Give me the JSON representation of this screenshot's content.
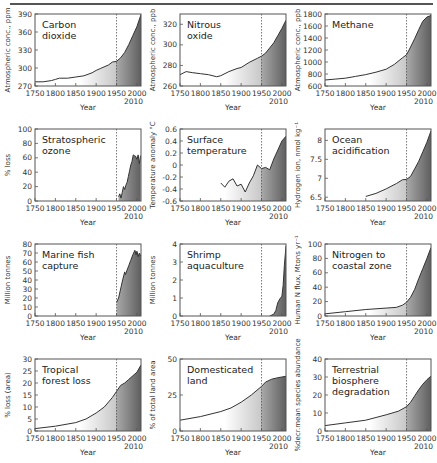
{
  "figure": {
    "shared_x_ticks": [
      "1750",
      "1800",
      "1850",
      "1900",
      "1950",
      "2000"
    ],
    "x_end_label": "2010",
    "xlabel": "Year",
    "marker_year": 1950,
    "colors": {
      "line": "#333333",
      "fill_light": "#ffffff",
      "fill_dark": "#6e6e6e",
      "frame": "#555555",
      "marker": "#555555"
    }
  },
  "chart_data": [
    {
      "type": "area",
      "title": "Carbon dioxide",
      "title_lines": [
        "Carbon",
        "dioxide"
      ],
      "xlabel": "Year",
      "ylabel": "Atmospheric conc., ppm",
      "xlim": [
        1750,
        2010
      ],
      "ylim": [
        270,
        390
      ],
      "yticks": [
        270,
        300,
        330,
        360,
        390
      ],
      "x": [
        1750,
        1770,
        1790,
        1800,
        1810,
        1830,
        1850,
        1870,
        1890,
        1900,
        1910,
        1930,
        1940,
        1950,
        1960,
        1970,
        1980,
        1990,
        2000,
        2010
      ],
      "values": [
        277,
        277,
        279,
        281,
        283,
        283,
        285,
        287,
        292,
        296,
        299,
        305,
        310,
        311,
        317,
        326,
        339,
        354,
        369,
        389
      ]
    },
    {
      "type": "area",
      "title": "Nitrous oxide",
      "title_lines": [
        "Nitrous",
        "oxide"
      ],
      "xlabel": "Year",
      "ylabel": "Atmospheric conc., ppb",
      "xlim": [
        1750,
        2010
      ],
      "ylim": [
        260,
        330
      ],
      "yticks": [
        260,
        280,
        300,
        320
      ],
      "x": [
        1750,
        1765,
        1780,
        1800,
        1820,
        1840,
        1850,
        1870,
        1890,
        1900,
        1920,
        1940,
        1950,
        1960,
        1970,
        1980,
        1990,
        2000,
        2010
      ],
      "values": [
        271,
        274,
        273,
        272,
        271,
        269,
        270,
        274,
        277,
        278,
        283,
        287,
        289,
        292,
        297,
        302,
        309,
        316,
        324
      ]
    },
    {
      "type": "area",
      "title": "Methane",
      "title_lines": [
        "Methane"
      ],
      "xlabel": "Year",
      "ylabel": "Atmospheric conc., ppb",
      "xlim": [
        1750,
        2010
      ],
      "ylim": [
        600,
        1800
      ],
      "yticks": [
        600,
        800,
        1000,
        1200,
        1400,
        1600,
        1800
      ],
      "x": [
        1750,
        1775,
        1800,
        1825,
        1850,
        1875,
        1900,
        1920,
        1940,
        1950,
        1960,
        1970,
        1980,
        1990,
        2000,
        2010
      ],
      "values": [
        700,
        715,
        730,
        760,
        790,
        830,
        880,
        960,
        1070,
        1120,
        1250,
        1390,
        1540,
        1680,
        1750,
        1775
      ]
    },
    {
      "type": "area",
      "title": "Stratospheric ozone",
      "title_lines": [
        "Stratospheric",
        "ozone"
      ],
      "xlabel": "Year",
      "ylabel": "% loss",
      "xlim": [
        1750,
        2010
      ],
      "ylim": [
        0,
        100
      ],
      "yticks": [
        0,
        20,
        40,
        60,
        80,
        100
      ],
      "x": [
        1955,
        1958,
        1961,
        1964,
        1967,
        1970,
        1973,
        1976,
        1979,
        1982,
        1985,
        1988,
        1991,
        1994,
        1997,
        2000,
        2003,
        2006,
        2009
      ],
      "values": [
        6,
        10,
        4,
        12,
        20,
        16,
        22,
        26,
        34,
        42,
        50,
        55,
        64,
        63,
        62,
        58,
        64,
        52,
        63
      ]
    },
    {
      "type": "line",
      "title": "Surface temperature",
      "title_lines": [
        "Surface",
        "temperature"
      ],
      "xlabel": "Year",
      "ylabel": "Temperature anomaly °C",
      "xlim": [
        1750,
        2010
      ],
      "ylim": [
        -0.6,
        0.6
      ],
      "yticks": [
        -0.6,
        -0.4,
        -0.2,
        0,
        0.2,
        0.4,
        0.6
      ],
      "x": [
        1850,
        1860,
        1870,
        1880,
        1890,
        1900,
        1910,
        1920,
        1930,
        1940,
        1950,
        1960,
        1970,
        1980,
        1990,
        2000,
        2010
      ],
      "values": [
        -0.3,
        -0.37,
        -0.27,
        -0.23,
        -0.35,
        -0.32,
        -0.45,
        -0.3,
        -0.18,
        0.0,
        -0.06,
        -0.04,
        -0.08,
        0.1,
        0.25,
        0.4,
        0.48
      ]
    },
    {
      "type": "area",
      "title": "Ocean acidification",
      "title_lines": [
        "Ocean",
        "acidification"
      ],
      "xlabel": "Year",
      "ylabel": "Hydrogen ion, nmol kg⁻¹",
      "xlim": [
        1750,
        2010
      ],
      "ylim": [
        6.4,
        8.3
      ],
      "yticks": [
        6.5,
        7.0,
        7.5,
        8.0
      ],
      "x": [
        1850,
        1875,
        1900,
        1925,
        1940,
        1950,
        1960,
        1970,
        1980,
        1990,
        2000,
        2010
      ],
      "values": [
        6.52,
        6.6,
        6.72,
        6.86,
        6.96,
        6.97,
        7.05,
        7.25,
        7.45,
        7.7,
        7.95,
        8.25
      ]
    },
    {
      "type": "area",
      "title": "Marine fish capture",
      "title_lines": [
        "Marine fish",
        "capture"
      ],
      "xlabel": "Year",
      "ylabel": "Million tonnes",
      "xlim": [
        1750,
        2010
      ],
      "ylim": [
        0,
        80
      ],
      "yticks": [
        0,
        10,
        20,
        30,
        40,
        50,
        60,
        70,
        80
      ],
      "x": [
        1950,
        1955,
        1960,
        1965,
        1970,
        1972,
        1975,
        1980,
        1985,
        1990,
        1995,
        1998,
        2000,
        2003,
        2006,
        2010
      ],
      "values": [
        15,
        20,
        30,
        40,
        49,
        46,
        50,
        56,
        62,
        68,
        73,
        68,
        72,
        66,
        70,
        66
      ]
    },
    {
      "type": "area",
      "title": "Shrimp aquaculture",
      "title_lines": [
        "Shrimp",
        "aquaculture"
      ],
      "xlabel": "Year",
      "ylabel": "Million tonnes",
      "xlim": [
        1750,
        2010
      ],
      "ylim": [
        0,
        4
      ],
      "yticks": [
        0,
        1,
        2,
        3,
        4
      ],
      "x": [
        1970,
        1975,
        1980,
        1985,
        1990,
        1995,
        2000,
        2003,
        2006,
        2010
      ],
      "values": [
        0.0,
        0.05,
        0.1,
        0.3,
        0.75,
        0.95,
        1.1,
        1.7,
        2.8,
        3.9
      ]
    },
    {
      "type": "area",
      "title": "Nitrogen to coastal zone",
      "title_lines": [
        "Nitrogen to",
        "coastal zone"
      ],
      "xlabel": "Year",
      "ylabel": "Human N flux, Mtons yr⁻¹",
      "xlim": [
        1750,
        2010
      ],
      "ylim": [
        0,
        100
      ],
      "yticks": [
        0,
        20,
        40,
        60,
        80,
        100
      ],
      "x": [
        1750,
        1800,
        1850,
        1900,
        1925,
        1940,
        1950,
        1960,
        1970,
        1980,
        1990,
        2000,
        2010
      ],
      "values": [
        3,
        6,
        9,
        11,
        12,
        15,
        19,
        26,
        37,
        52,
        66,
        80,
        95
      ]
    },
    {
      "type": "area",
      "title": "Tropical forest loss",
      "title_lines": [
        "Tropical",
        "forest loss"
      ],
      "xlabel": "Year",
      "ylabel": "% loss (area)",
      "xlim": [
        1750,
        2010
      ],
      "ylim": [
        0,
        30
      ],
      "yticks": [
        0,
        5,
        10,
        15,
        20,
        25,
        30
      ],
      "x": [
        1750,
        1800,
        1850,
        1875,
        1900,
        1920,
        1940,
        1950,
        1960,
        1970,
        1980,
        1990,
        2000,
        2010
      ],
      "values": [
        1,
        2,
        3.5,
        5,
        7.5,
        10,
        14,
        16.5,
        19,
        20,
        21.5,
        23,
        24.5,
        27.5
      ]
    },
    {
      "type": "area",
      "title": "Domesticated land",
      "title_lines": [
        "Domesticated",
        "land"
      ],
      "xlabel": "Year",
      "ylabel": "% of total land area",
      "xlim": [
        1750,
        2010
      ],
      "ylim": [
        0,
        50
      ],
      "yticks": [
        0,
        25,
        50
      ],
      "x": [
        1750,
        1800,
        1850,
        1875,
        1900,
        1925,
        1950,
        1960,
        1975,
        1990,
        2000,
        2010
      ],
      "values": [
        7.5,
        10,
        13.5,
        16,
        20,
        25,
        31,
        34,
        36,
        37,
        37.5,
        38
      ]
    },
    {
      "type": "area",
      "title": "Terrestrial biosphere degradation",
      "title_lines": [
        "Terrestrial",
        "biosphere",
        "degradation"
      ],
      "xlabel": "Year",
      "ylabel": "%decr.mean species abundance",
      "xlim": [
        1750,
        2010
      ],
      "ylim": [
        0,
        40
      ],
      "yticks": [
        0,
        10,
        20,
        30,
        40
      ],
      "x": [
        1750,
        1800,
        1850,
        1900,
        1930,
        1950,
        1960,
        1970,
        1980,
        1990,
        2000,
        2010
      ],
      "values": [
        3,
        4.5,
        6,
        9,
        11,
        13.5,
        16,
        19.5,
        23,
        26,
        28.5,
        30.5
      ]
    }
  ]
}
